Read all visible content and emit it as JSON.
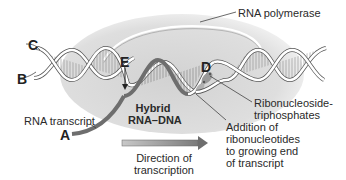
{
  "figure": {
    "letters": {
      "a": "A",
      "b": "B",
      "c": "C",
      "d": "D",
      "e": "E"
    },
    "labels": {
      "rna_polymerase": "RNA polymerase",
      "rna_transcript": "RNA transcript",
      "hybrid_line1": "Hybrid",
      "hybrid_line2": "RNA–DNA",
      "direction_line1": "Direction of",
      "direction_line2": "transcription",
      "ntp_line1": "Ribonucleoside-",
      "ntp_line2": "triphosphates",
      "addition_line1": "Addition of",
      "addition_line2": "ribonucleotides",
      "addition_line3": "to growing end",
      "addition_line4": "of transcript"
    },
    "colors": {
      "polymerase_fill": "#dcdcdc",
      "polymerase_edge": "#f2f2f2",
      "dna_strand": "#ffffff",
      "dna_outline": "#555555",
      "rna_strand": "#7a7a7a",
      "arrow_fill": "#9a9a9a",
      "text": "#222222"
    }
  }
}
